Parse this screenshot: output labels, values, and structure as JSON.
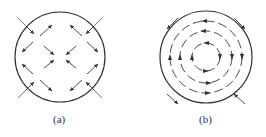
{
  "figure": {
    "panels": [
      {
        "id": "a",
        "label": "(a)",
        "description": "Circle with diagonal field arrows (quadrupole-like pattern)"
      },
      {
        "id": "b",
        "label": "(b)",
        "description": "Concentric circular arrows (vortex pattern) inside a circle"
      }
    ],
    "colors": {
      "stroke": "#333333",
      "background": "#ffffff"
    }
  }
}
